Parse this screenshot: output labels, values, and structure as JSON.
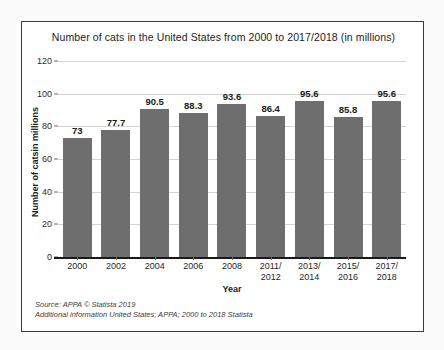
{
  "chart_data": {
    "type": "bar",
    "title": "Number of cats in the United States from 2000 to 2017/2018 (in millions)",
    "xlabel": "Year",
    "ylabel": "Number of catsin millions",
    "categories": [
      "2000",
      "2002",
      "2004",
      "2006",
      "2008",
      "2011/\n2012",
      "2013/\n2014",
      "2015/\n2016",
      "2017/\n2018"
    ],
    "category_lines": [
      [
        "2000"
      ],
      [
        "2002"
      ],
      [
        "2004"
      ],
      [
        "2006"
      ],
      [
        "2008"
      ],
      [
        "2011/",
        "2012"
      ],
      [
        "2013/",
        "2014"
      ],
      [
        "2015/",
        "2016"
      ],
      [
        "2017/",
        "2018"
      ]
    ],
    "values": [
      73,
      77.7,
      90.5,
      88.3,
      93.6,
      86.4,
      95.6,
      85.8,
      95.6
    ],
    "value_labels": [
      "73",
      "77.7",
      "90.5",
      "88.3",
      "93.6",
      "86.4",
      "95.6",
      "85.8",
      "95.6"
    ],
    "ylim": [
      0,
      120
    ],
    "yticks": [
      0,
      20,
      40,
      60,
      80,
      100,
      120
    ],
    "ytick_labels": [
      "0",
      "20",
      "40",
      "60",
      "80",
      "100",
      "120"
    ],
    "grid": true,
    "legend": false,
    "bar_color": "#6e6e6e",
    "gridline_color": "#d4d4d4",
    "axis_color": "#1a1a1a"
  },
  "footnote": {
    "line1": "Source: APPA © Statista 2019",
    "line2": "Additional information United States; APPA; 2000 to 2018 Statista"
  }
}
